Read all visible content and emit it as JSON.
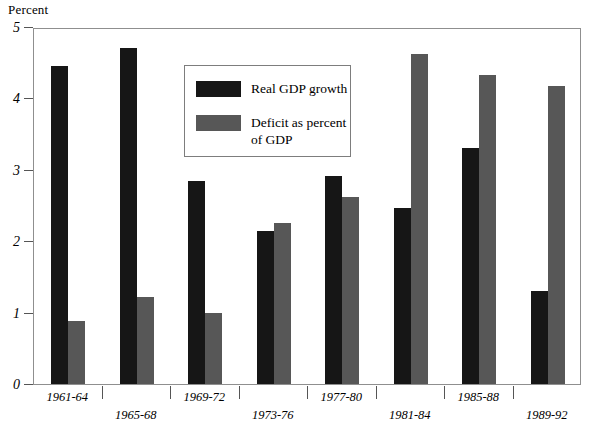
{
  "chart_data": {
    "type": "bar",
    "title": "",
    "xlabel": "",
    "ylabel": "Percent",
    "ylim": [
      0,
      5
    ],
    "yticks": [
      0,
      1,
      2,
      3,
      4,
      5
    ],
    "ytick_labels": [
      "0",
      "1",
      "2",
      "3",
      "4",
      "5"
    ],
    "grid": false,
    "legend_position": "upper center inside",
    "categories": [
      "1961-64",
      "1965-68",
      "1969-72",
      "1973-76",
      "1977-80",
      "1981-84",
      "1985-88",
      "1989-92"
    ],
    "series": [
      {
        "name": "Real GDP growth",
        "color": "#161616",
        "values": [
          4.45,
          4.7,
          2.85,
          2.15,
          2.92,
          2.47,
          3.3,
          1.3
        ]
      },
      {
        "name": "Deficit as percent of GDP",
        "color": "#575757",
        "values": [
          0.88,
          1.22,
          1.0,
          2.25,
          2.62,
          4.62,
          4.33,
          4.18
        ]
      }
    ]
  },
  "legend": {
    "items": [
      {
        "label": "Real GDP growth",
        "swatch": "legend-swatch-black"
      },
      {
        "label": "Deficit as percent of GDP",
        "swatch": "legend-swatch-gray"
      }
    ]
  },
  "axes": {
    "y_title": "Percent"
  }
}
